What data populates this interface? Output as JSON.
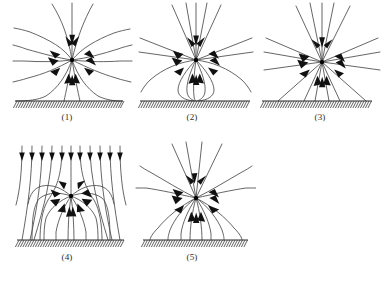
{
  "figure": {
    "title": "",
    "type": "physics-field-line-diagram",
    "panel_count": 5,
    "description_visible": false
  },
  "captions": {
    "p1": "(1)",
    "p2": "(2)",
    "p3": "(3)",
    "p4": "(4)",
    "p5": "(5)"
  },
  "colors": {
    "line": "#4a4a4a",
    "arrow": "#111111",
    "charge": "#000000",
    "ground": "#2a2a2a",
    "hatch": "#3a3a3a",
    "background": "#ffffff",
    "caption": "#2b2b2b"
  },
  "panels": [
    {
      "id": "p1",
      "caption": "(1)",
      "charge": {
        "x": 72,
        "y": 60,
        "polarity": "negative",
        "radius": 2.2
      },
      "ground": {
        "x1": 15,
        "x2": 123,
        "y": 101,
        "hatch_count": 44,
        "hatch_len": 7,
        "hatch_slant": -4
      },
      "arrow_count": 12,
      "line_style": "curved",
      "notes": "radial lines bend toward grounded plane"
    },
    {
      "id": "p2",
      "caption": "(2)",
      "charge": {
        "x": 196,
        "y": 60,
        "polarity": "negative",
        "radius": 2.2
      },
      "ground": {
        "x1": 140,
        "x2": 250,
        "y": 101,
        "hatch_count": 44,
        "hatch_len": 7,
        "hatch_slant": -4
      },
      "arrow_count": 12,
      "line_style": "straight-with-loops",
      "notes": "straight radial lines plus closed loops touching the plane"
    },
    {
      "id": "p3",
      "caption": "(3)",
      "charge": {
        "x": 322,
        "y": 62,
        "polarity": "negative",
        "radius": 2.2
      },
      "ground": {
        "x1": 262,
        "x2": 372,
        "y": 101,
        "hatch_count": 44,
        "hatch_len": 7,
        "hatch_slant": -4
      },
      "arrow_count": 12,
      "line_style": "straight",
      "notes": "purely straight radial lines in all directions"
    },
    {
      "id": "p4",
      "caption": "(4)",
      "charge": {
        "x": 71,
        "y": 196,
        "polarity": "negative",
        "radius": 2.2
      },
      "ground": {
        "x1": 17,
        "x2": 124,
        "y": 240,
        "hatch_count": 44,
        "hatch_len": 7,
        "hatch_slant": -4
      },
      "arrow_count": 12,
      "top_arrow_count": 11,
      "line_style": "uniform-field-plus-charge",
      "notes": "uniform downward field lines from top bending to ground and charge"
    },
    {
      "id": "p5",
      "caption": "(5)",
      "charge": {
        "x": 196,
        "y": 198,
        "polarity": "negative",
        "radius": 2.2
      },
      "ground": {
        "x1": 143,
        "x2": 248,
        "y": 240,
        "hatch_count": 42,
        "hatch_len": 7,
        "hatch_slant": -4
      },
      "arrow_count": 12,
      "line_style": "straight-above-arcs-below",
      "notes": "straight lines above, arcs rising from ground below"
    }
  ]
}
